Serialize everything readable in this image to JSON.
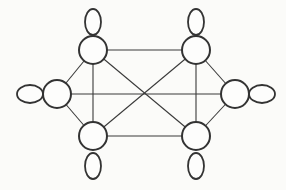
{
  "diagram": {
    "type": "graph",
    "stroke_color": "#333333",
    "background": "#fbfbf9",
    "nodes": [
      {
        "id": "top-left",
        "cx": 93,
        "cy": 50,
        "r": 14,
        "loop": {
          "cx": 93,
          "cy": 22,
          "rx": 8,
          "ry": 13
        }
      },
      {
        "id": "top-right",
        "cx": 196,
        "cy": 50,
        "r": 14,
        "loop": {
          "cx": 196,
          "cy": 22,
          "rx": 8,
          "ry": 13
        }
      },
      {
        "id": "left",
        "cx": 57,
        "cy": 94,
        "r": 14,
        "loop": {
          "cx": 30,
          "cy": 94,
          "rx": 13,
          "ry": 9
        }
      },
      {
        "id": "right",
        "cx": 235,
        "cy": 94,
        "r": 14,
        "loop": {
          "cx": 262,
          "cy": 94,
          "rx": 13,
          "ry": 9
        }
      },
      {
        "id": "bottom-left",
        "cx": 93,
        "cy": 136,
        "r": 14,
        "loop": {
          "cx": 93,
          "cy": 166,
          "rx": 8,
          "ry": 13
        }
      },
      {
        "id": "bottom-right",
        "cx": 196,
        "cy": 136,
        "r": 14,
        "loop": {
          "cx": 196,
          "cy": 166,
          "rx": 8,
          "ry": 13
        }
      }
    ],
    "edges": [
      [
        "top-left",
        "top-right"
      ],
      [
        "bottom-left",
        "bottom-right"
      ],
      [
        "top-left",
        "bottom-left"
      ],
      [
        "top-right",
        "bottom-right"
      ],
      [
        "left",
        "right"
      ],
      [
        "top-left",
        "left"
      ],
      [
        "bottom-left",
        "left"
      ],
      [
        "top-right",
        "right"
      ],
      [
        "bottom-right",
        "right"
      ],
      [
        "top-left",
        "bottom-right"
      ],
      [
        "top-right",
        "bottom-left"
      ]
    ]
  }
}
